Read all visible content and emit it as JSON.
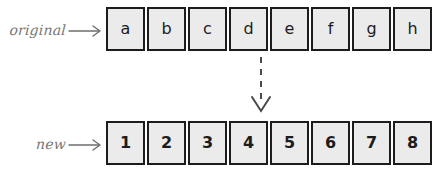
{
  "diagram": {
    "colors": {
      "cell_fill": "#ebebeb",
      "cell_border": "#1c1c1c",
      "label_text": "#757575",
      "arrow": "#6e6e6e",
      "dashed_arrow": "#4a4a4a",
      "background": "#ffffff"
    },
    "rows": [
      {
        "id": "original",
        "label": "original",
        "arrow_icon": "right-arrow-icon",
        "cells": [
          "a",
          "b",
          "c",
          "d",
          "e",
          "f",
          "g",
          "h"
        ]
      },
      {
        "id": "new",
        "label": "new",
        "arrow_icon": "right-arrow-icon",
        "cells": [
          "1",
          "2",
          "3",
          "4",
          "5",
          "6",
          "7",
          "8"
        ]
      }
    ],
    "transform": {
      "icon": "dashed-down-arrow-icon",
      "style": "dashed",
      "direction": "down"
    }
  }
}
